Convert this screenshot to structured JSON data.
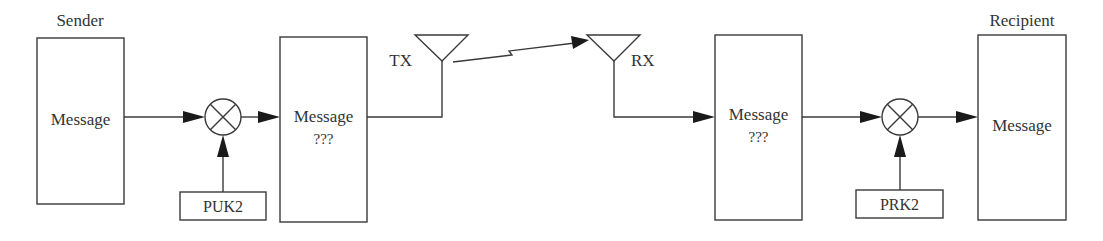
{
  "diagram": {
    "sender": {
      "title": "Sender",
      "box_label": "Message"
    },
    "encryption_stage": {
      "operator_symbol": "circle-times-mixer",
      "key_label": "PUK2"
    },
    "encrypted_message_tx": {
      "line1": "Message",
      "line2": "???"
    },
    "transmitter": {
      "label": "TX"
    },
    "receiver": {
      "label": "RX"
    },
    "encrypted_message_rx": {
      "line1": "Message",
      "line2": "???"
    },
    "decryption_stage": {
      "operator_symbol": "circle-times-mixer",
      "key_label": "PRK2"
    },
    "recipient": {
      "title": "Recipient",
      "box_label": "Message"
    },
    "colors": {
      "stroke": "#3a3a3a",
      "text": "#333333",
      "arrowhead": "#1a1a1a",
      "background": "#ffffff"
    }
  }
}
